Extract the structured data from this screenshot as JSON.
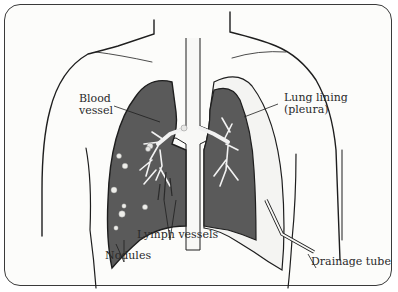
{
  "diagram": {
    "title": "",
    "colors": {
      "lung_fill": "#5a5a5a",
      "outline": "#1e1e1e",
      "background": "#fcfcfa",
      "vessel": "#f2f2f2"
    },
    "labels": {
      "blood_vessel_line1": "Blood",
      "blood_vessel_line2": "vessel",
      "lung_lining_line1": "Lung lining",
      "lung_lining_line2": "(pleura)",
      "lymph_vessels": "Lymph vessels",
      "nodules": "Nodules",
      "drainage_tube": "Drainage tube"
    }
  }
}
